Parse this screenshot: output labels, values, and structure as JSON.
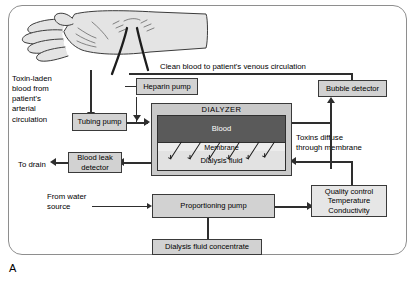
{
  "figure": {
    "panel_label": "A",
    "type": "hemodialysis-circuit-diagram"
  },
  "artwork": {
    "arm_illustration": "patient-hand-and-forearm-with-vascular-access",
    "access_site": "arteriovenous-fistula"
  },
  "labels": {
    "toxin_laden": "Toxin-laden\nblood from\npatient's\narterial\ncirculation",
    "clean_blood": "Clean blood to patient's venous circulation",
    "toxins_diffuse": "Toxins diffuse\nthrough membrane",
    "to_drain": "To drain",
    "from_water": "From water\nsource"
  },
  "boxes": {
    "tubing_pump": "Tubing pump",
    "heparin_pump": "Heparin pump",
    "bubble_detector": "Bubble detector",
    "blood_leak_detector": "Blood leak\ndetector",
    "proportioning_pump": "Proportioning pump",
    "dialysis_fluid_concentrate": "Dialysis fluid concentrate",
    "quality_control": "Quality control\nTemperature\nConductivity"
  },
  "dialyzer": {
    "title": "DIALYZER",
    "blood_compartment": "Blood",
    "membrane": "Membrane",
    "dialysate_compartment": "Dialysis fluid",
    "diffusion_arrow_count": 6
  },
  "colors": {
    "box_fill": "#d2d2d2",
    "blood_chamber": "#5a5a5a",
    "dialyzer_frame": "#c9c9c9",
    "line": "#2e2e2e",
    "frame_border": "#8e8e8e"
  }
}
